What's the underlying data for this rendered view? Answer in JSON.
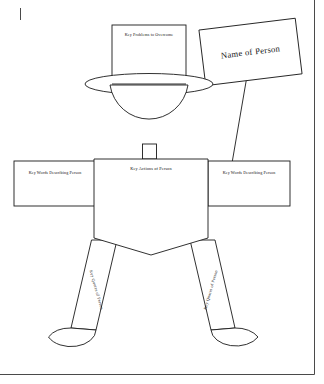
{
  "document": {
    "title": "Body Biography Graphic Organizer",
    "type": "worksheet-diagram",
    "background_color": "#ffffff",
    "ink_color": "#1a1a1a",
    "frame_color": "#4a4a4a"
  },
  "figure": {
    "name": "body-biography-outline",
    "parts": {
      "hat_box": {
        "label": "Key Problems to Overcome",
        "shape": "rectangle"
      },
      "hat_brim": {
        "label": "",
        "shape": "ellipse"
      },
      "head": {
        "label": "",
        "shape": "circle"
      },
      "neck": {
        "label": "",
        "shape": "rectangle"
      },
      "torso": {
        "label": "Key Actions of Person",
        "shape": "pentagon"
      },
      "left_arm": {
        "label": "Key Words Describing Person",
        "shape": "rectangle"
      },
      "right_arm": {
        "label": "Key Words Describing Person",
        "shape": "rectangle"
      },
      "left_leg": {
        "label": "Key Quotes of Person",
        "shape": "parallelogram"
      },
      "right_leg": {
        "label": "Key Quotes of Person",
        "shape": "parallelogram"
      },
      "left_foot": {
        "label": "",
        "shape": "half-ellipse"
      },
      "right_foot": {
        "label": "",
        "shape": "half-ellipse"
      }
    }
  },
  "sign": {
    "label": "Name of Person",
    "shape": "rotated-rectangle",
    "pole": "diagonal-line"
  }
}
